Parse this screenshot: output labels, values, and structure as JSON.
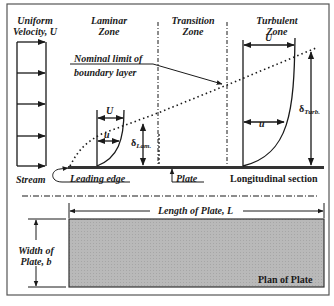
{
  "diagram": {
    "type": "boundary-layer-flat-plate",
    "colors": {
      "frame": "#555555",
      "ink": "#1a1a1a",
      "plate_fill": "#b8b8b8"
    },
    "freestream": {
      "label_line1": "Uniform",
      "label_line2": "Velocity, U",
      "stream_label": "Stream",
      "arrow_count": 5
    },
    "zones": [
      {
        "line1": "Laminar",
        "line2": "Zone"
      },
      {
        "line1": "Transition",
        "line2": "Zone"
      },
      {
        "line1": "Turbulent",
        "line2": "Zone"
      }
    ],
    "annotations": {
      "nominal_limit_line1": "Nominal limit of",
      "nominal_limit_line2": "boundary layer",
      "laminar_U": "U",
      "laminar_u": "u",
      "delta_lam_symbol": "δ",
      "delta_lam_sub": "Lam.",
      "turbulent_U": "U",
      "turbulent_u": "u",
      "delta_turb_symbol": "δ",
      "delta_turb_sub": "Turb.",
      "leading_edge": "Leading edge",
      "plate": "Plate",
      "longitudinal_section": "Longitudinal section"
    },
    "plan": {
      "length_label": "Length of Plate, L",
      "width_line1": "Width of",
      "width_line2": "Plate, b",
      "plan_label": "Plan of Plate"
    }
  }
}
